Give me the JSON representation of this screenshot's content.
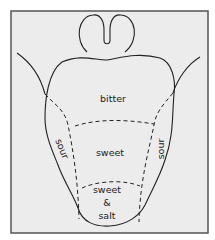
{
  "diagram": {
    "type": "tongue-taste-map",
    "regions": {
      "back": "bitter",
      "left_side": "sour",
      "right_side": "sour",
      "middle": "sweet",
      "tip_line1": "sweet",
      "tip_line2": "&",
      "tip_line3": "salt"
    },
    "colors": {
      "background": "#ececec",
      "frame": "#555555",
      "outline": "#222222"
    }
  }
}
